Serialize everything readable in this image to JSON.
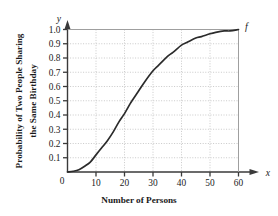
{
  "chart_data": {
    "type": "line",
    "title": "",
    "xlabel": "Number of Persons",
    "ylabel_line1": "Probability of Two People Sharing",
    "ylabel_line2": "the Same Birthday",
    "x_axis_variable": "x",
    "y_axis_variable": "y",
    "curve_label": "f",
    "grid": true,
    "legend": "none",
    "xlim": [
      0,
      60
    ],
    "ylim": [
      0,
      1.0
    ],
    "xticks": [
      0,
      10,
      20,
      30,
      40,
      50,
      60
    ],
    "xtick_labels": [
      "0",
      "10",
      "20",
      "30",
      "40",
      "50",
      "60"
    ],
    "yticks": [
      0.1,
      0.2,
      0.3,
      0.4,
      0.5,
      0.6,
      0.7,
      0.8,
      0.9,
      1.0
    ],
    "ytick_labels": [
      "0.1",
      "0.2",
      "0.3",
      "0.4",
      "0.5",
      "0.6",
      "0.7",
      "0.8",
      "0.9",
      "1.0"
    ],
    "y_origin_label": "0",
    "series": [
      {
        "name": "f",
        "x": [
          0,
          2,
          4,
          6,
          8,
          10,
          12,
          14,
          16,
          18,
          20,
          22,
          23,
          25,
          27,
          30,
          32,
          35,
          37,
          40,
          42,
          45,
          47,
          50,
          52,
          55,
          57,
          60
        ],
        "values": [
          0.0,
          0.005,
          0.016,
          0.04,
          0.07,
          0.12,
          0.17,
          0.22,
          0.28,
          0.35,
          0.41,
          0.48,
          0.51,
          0.57,
          0.63,
          0.71,
          0.75,
          0.81,
          0.84,
          0.89,
          0.91,
          0.94,
          0.95,
          0.97,
          0.98,
          0.99,
          0.99,
          1.0
        ]
      }
    ],
    "colors": {
      "curve": "#2b2b2b",
      "axis": "#3a3a3a",
      "grid": "#c9c9c9",
      "text": "#1a1a1a",
      "background": "#ffffff"
    }
  }
}
